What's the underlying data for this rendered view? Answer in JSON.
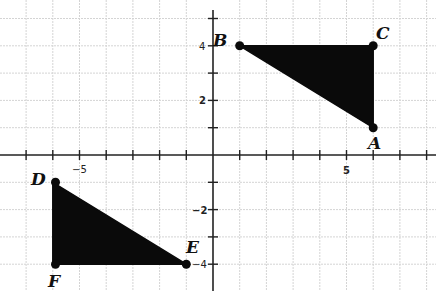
{
  "figure": {
    "type": "coordinate-plane",
    "x_range": [
      -8,
      8
    ],
    "y_range": [
      -5,
      5
    ],
    "axis_tick_labels": {
      "x": [
        {
          "value": -5,
          "label": "−5"
        },
        {
          "value": 5,
          "label": "5"
        }
      ],
      "y": [
        {
          "value": 4,
          "label": "4"
        },
        {
          "value": 2,
          "label": "2"
        },
        {
          "value": -2,
          "label": "−2"
        },
        {
          "value": -4,
          "label": "−4"
        }
      ]
    },
    "grid": true,
    "colors": {
      "fill": "#0a0a0a",
      "grid": "#d4d4d4",
      "axis": "#222222"
    }
  },
  "triangles": [
    {
      "name": "ABC",
      "points": [
        {
          "label": "A",
          "x": 6,
          "y": 1
        },
        {
          "label": "B",
          "x": 1,
          "y": 4
        },
        {
          "label": "C",
          "x": 6,
          "y": 4
        }
      ]
    },
    {
      "name": "DEF",
      "points": [
        {
          "label": "D",
          "x": -6,
          "y": -1
        },
        {
          "label": "E",
          "x": -1,
          "y": -4
        },
        {
          "label": "F",
          "x": -6,
          "y": -4
        }
      ]
    }
  ],
  "labels": {
    "A": "A",
    "B": "B",
    "C": "C",
    "D": "D",
    "E": "E",
    "F": "F",
    "x_neg5": "−5",
    "x_5": "5",
    "y_4": "4",
    "y_2": "2",
    "y_neg2": "−2",
    "y_neg4": "−4"
  }
}
